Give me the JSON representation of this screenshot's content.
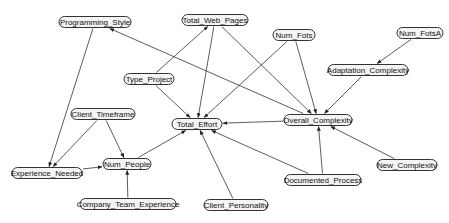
{
  "diagram": {
    "type": "directed-graph",
    "colors": {
      "node_fill": "#f4f4f4",
      "node_stroke": "#333333",
      "edge": "#333333",
      "background": "#ffffff"
    },
    "nodes": [
      {
        "id": "programming_style",
        "label": "Programming_Style",
        "x": 95,
        "y": 22,
        "w": 72
      },
      {
        "id": "total_web_pages",
        "label": "Total_Web_Pages",
        "x": 215,
        "y": 20,
        "w": 66
      },
      {
        "id": "num_fots",
        "label": "Num_Fots",
        "x": 294,
        "y": 35,
        "w": 42
      },
      {
        "id": "num_fotsa",
        "label": "Num_FotsA",
        "x": 420,
        "y": 33,
        "w": 46
      },
      {
        "id": "adaptation_complexity",
        "label": "Adaptation_Complexity",
        "x": 368,
        "y": 70,
        "w": 80
      },
      {
        "id": "type_project",
        "label": "Type_Project",
        "x": 149,
        "y": 79,
        "w": 50
      },
      {
        "id": "client_timeframe",
        "label": "Client_Timeframe",
        "x": 103,
        "y": 114,
        "w": 64
      },
      {
        "id": "total_effort",
        "label": "Total_Effort",
        "x": 197,
        "y": 124,
        "w": 50
      },
      {
        "id": "overall_complexity",
        "label": "Overall_Complexity",
        "x": 318,
        "y": 120,
        "w": 68
      },
      {
        "id": "experience_needed",
        "label": "Experience_Needed",
        "x": 47,
        "y": 173,
        "w": 70
      },
      {
        "id": "num_people",
        "label": "Num_People",
        "x": 127,
        "y": 164,
        "w": 48
      },
      {
        "id": "new_complexity",
        "label": "New_Complexity",
        "x": 407,
        "y": 165,
        "w": 60
      },
      {
        "id": "documented_process",
        "label": "Documented_Process",
        "x": 323,
        "y": 180,
        "w": 76
      },
      {
        "id": "company_team_experience",
        "label": "Company_Team_Experience",
        "x": 128,
        "y": 204,
        "w": 96
      },
      {
        "id": "client_personality",
        "label": "Client_Personality",
        "x": 236,
        "y": 205,
        "w": 64
      }
    ],
    "edges": [
      {
        "from": "programming_style",
        "to": "experience_needed"
      },
      {
        "from": "overall_complexity",
        "to": "programming_style"
      },
      {
        "from": "type_project",
        "to": "total_web_pages"
      },
      {
        "from": "type_project",
        "to": "total_effort"
      },
      {
        "from": "total_web_pages",
        "to": "total_effort"
      },
      {
        "from": "total_web_pages",
        "to": "overall_complexity"
      },
      {
        "from": "num_fots",
        "to": "total_effort"
      },
      {
        "from": "num_fots",
        "to": "overall_complexity"
      },
      {
        "from": "num_fotsa",
        "to": "adaptation_complexity"
      },
      {
        "from": "adaptation_complexity",
        "to": "overall_complexity"
      },
      {
        "from": "overall_complexity",
        "to": "total_effort"
      },
      {
        "from": "client_timeframe",
        "to": "experience_needed"
      },
      {
        "from": "client_timeframe",
        "to": "num_people"
      },
      {
        "from": "experience_needed",
        "to": "num_people"
      },
      {
        "from": "num_people",
        "to": "total_effort"
      },
      {
        "from": "company_team_experience",
        "to": "num_people"
      },
      {
        "from": "client_personality",
        "to": "total_effort"
      },
      {
        "from": "documented_process",
        "to": "total_effort"
      },
      {
        "from": "documented_process",
        "to": "overall_complexity"
      },
      {
        "from": "new_complexity",
        "to": "overall_complexity"
      }
    ]
  }
}
